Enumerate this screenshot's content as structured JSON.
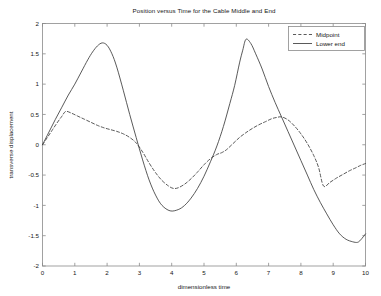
{
  "figure": {
    "title": "Position versus Time for the Cable Middle and End",
    "background": "#ffffff",
    "axis_color": "#8a8a8a",
    "line_color": "#3c3c3c"
  },
  "axes": {
    "xlabel": "dimensionless time",
    "ylabel": "transverse displacement",
    "xticks": [
      "0",
      "1",
      "2",
      "3",
      "4",
      "5",
      "6",
      "7",
      "8",
      "9",
      "10"
    ],
    "yticks": [
      "2",
      "1.5",
      "1",
      "0.5",
      "0",
      "-0.5",
      "-1",
      "-1.5",
      "-2"
    ]
  },
  "legend": {
    "position": "top-right",
    "entries": [
      {
        "label": "Midpoint",
        "style": "dashed"
      },
      {
        "label": "Lower end",
        "style": "solid"
      }
    ]
  },
  "chart_data": {
    "type": "line",
    "title": "Position versus Time for the Cable Middle and End",
    "xlabel": "dimensionless time",
    "ylabel": "transverse displacement",
    "xlim": [
      0,
      10
    ],
    "ylim": [
      -2,
      2
    ],
    "xticks": [
      0,
      1,
      2,
      3,
      4,
      5,
      6,
      7,
      8,
      9,
      10
    ],
    "yticks": [
      2,
      1.5,
      1,
      0.5,
      0,
      -0.5,
      -1,
      -1.5,
      -2
    ],
    "grid": false,
    "legend_position": "upper right",
    "series": [
      {
        "name": "Midpoint",
        "style": "dashed",
        "color": "#3c3c3c",
        "x": [
          0.0,
          0.15,
          0.3,
          0.45,
          0.6,
          0.72,
          0.9,
          1.1,
          1.3,
          1.5,
          1.7,
          1.9,
          2.1,
          2.3,
          2.5,
          2.7,
          2.9,
          3.1,
          3.3,
          3.5,
          3.7,
          3.9,
          4.05,
          4.2,
          4.4,
          4.6,
          4.8,
          5.0,
          5.2,
          5.4,
          5.55,
          5.7,
          5.9,
          6.1,
          6.3,
          6.5,
          6.7,
          6.9,
          7.1,
          7.25,
          7.4,
          7.6,
          7.8,
          8.0,
          8.2,
          8.4,
          8.55,
          8.7,
          8.9,
          9.1,
          9.3,
          9.5,
          9.7,
          9.85,
          10.0
        ],
        "y": [
          0.0,
          0.12,
          0.24,
          0.36,
          0.47,
          0.55,
          0.52,
          0.47,
          0.42,
          0.37,
          0.32,
          0.28,
          0.25,
          0.22,
          0.18,
          0.12,
          0.03,
          -0.12,
          -0.3,
          -0.46,
          -0.59,
          -0.68,
          -0.72,
          -0.71,
          -0.65,
          -0.56,
          -0.45,
          -0.33,
          -0.23,
          -0.16,
          -0.13,
          -0.08,
          0.02,
          0.12,
          0.2,
          0.27,
          0.33,
          0.38,
          0.43,
          0.45,
          0.46,
          0.41,
          0.31,
          0.18,
          0.02,
          -0.18,
          -0.38,
          -0.68,
          -0.62,
          -0.55,
          -0.49,
          -0.43,
          -0.38,
          -0.34,
          -0.31
        ]
      },
      {
        "name": "Lower end",
        "style": "solid",
        "color": "#3c3c3c",
        "x": [
          0.0,
          0.2,
          0.4,
          0.6,
          0.8,
          1.0,
          1.2,
          1.4,
          1.55,
          1.7,
          1.85,
          2.0,
          2.15,
          2.3,
          2.5,
          2.7,
          2.9,
          3.1,
          3.3,
          3.5,
          3.7,
          3.95,
          4.2,
          4.4,
          4.6,
          4.8,
          5.0,
          5.2,
          5.4,
          5.6,
          5.8,
          5.95,
          6.1,
          6.2,
          6.3,
          6.45,
          6.6,
          6.8,
          7.0,
          7.2,
          7.4,
          7.6,
          7.8,
          8.0,
          8.2,
          8.4,
          8.6,
          8.8,
          9.0,
          9.2,
          9.4,
          9.6,
          9.75,
          9.85,
          10.0
        ],
        "y": [
          0.0,
          0.21,
          0.42,
          0.62,
          0.82,
          1.0,
          1.2,
          1.4,
          1.53,
          1.63,
          1.68,
          1.64,
          1.5,
          1.28,
          0.9,
          0.5,
          0.12,
          -0.25,
          -0.58,
          -0.83,
          -1.0,
          -1.09,
          -1.07,
          -1.0,
          -0.88,
          -0.72,
          -0.52,
          -0.28,
          -0.02,
          0.3,
          0.68,
          0.98,
          1.35,
          1.56,
          1.74,
          1.67,
          1.5,
          1.25,
          0.96,
          0.7,
          0.46,
          0.22,
          -0.02,
          -0.26,
          -0.5,
          -0.74,
          -0.95,
          -1.14,
          -1.32,
          -1.47,
          -1.56,
          -1.6,
          -1.61,
          -1.57,
          -1.47
        ]
      }
    ]
  }
}
